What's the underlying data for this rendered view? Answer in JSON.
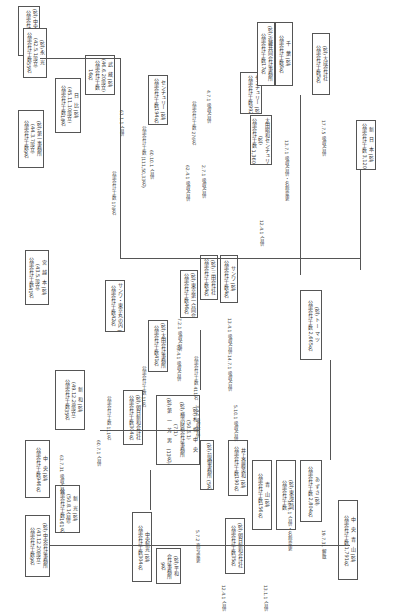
{
  "diagram": {
    "nodes": [
      {
        "id": "chuo_kaikei",
        "text": "(監) 中央会計事務所\n(43.12.20設立)\n公認会計士数9名"
      },
      {
        "id": "shinko",
        "text": "新　光 (監)\n(50.8.1合併)\n公認会計士数161名"
      },
      {
        "id": "chuo_shinko",
        "text": "中央新光 (監)\n公認会計士数304名"
      },
      {
        "id": "heiwa",
        "text": "(監) 平和\n会計事務所\n9名"
      },
      {
        "id": "genso",
        "text": "元 6.1\n公認会計士数\n544名"
      },
      {
        "id": "chuo",
        "text": "中　央 (監)\n公認会計士数946名"
      },
      {
        "id": "asahi_shinwa",
        "text": "(監) 朝日新和会計社\n公認会計士数35名"
      },
      {
        "id": "seiwa",
        "text": "(監) 朝日会計社\n(49.7.31設立)\n公認会計士数14名"
      },
      {
        "id": "shinwa",
        "text": "新　和 (監)\n(49.12.28設立)\n公認会計士数35名"
      },
      {
        "id": "kyoritsu",
        "text": "(監) 朝日新和会計社\n公認会計士数304名"
      },
      {
        "id": "sapporo",
        "text": "(監) 札　幌　中　央\n(50.6.1)\n(監) 横浜財務会計事務所\n(7.1)\n(監) 第　一　芳　男　(13名)"
      },
      {
        "id": "maebashi",
        "text": "(監) 前橋事務所 (5名)"
      },
      {
        "id": "inoue",
        "text": "井上斎藤英和 (監)\n公認会計士数190名"
      },
      {
        "id": "aoyama",
        "text": "青　山 (監)\n公認会計士数156名"
      },
      {
        "id": "chuo_aoyama",
        "text": "中　央　青　山 (監)\n公認会計士数 1,791名"
      },
      {
        "id": "nakagawa",
        "text": "(監) 中央会計事務所\n公認会計士数45名"
      },
      {
        "id": "miyakoshi",
        "text": "宮　越　本 (監)\n(43.5.設立)\n公認会計士数41名"
      },
      {
        "id": "century_ginza",
        "text": "サンワ・東京丸の内 (監)\n公認会計士数42名"
      },
      {
        "id": "ohta_tokyo",
        "text": "(監) 太田会計事務所\n公認会計士数41名"
      },
      {
        "id": "century_tokyo",
        "text": "(監) 東京第一合同会計\n公認会計士数46名"
      },
      {
        "id": "showa",
        "text": "(監) 三田会計社\n公認会計士数4名"
      },
      {
        "id": "sanwa",
        "text": "サンワ (監)\n公認会計士数4名"
      },
      {
        "id": "ohta_showa",
        "text": "(監) 太田昭和会計事務所\n公認会計士数41名"
      },
      {
        "id": "azusa",
        "text": "あ ず さ (監)\n公認会計士数 2,804名"
      },
      {
        "id": "tohmatsu",
        "text": "(監) ト ー マ ツ\n公認会計士数 2,665名"
      },
      {
        "id": "ohta_daiichi",
        "text": "太田昭和 (監)\n公認会計士数"
      },
      {
        "id": "nishi_shinju",
        "text": "(監) 西新宿会計事務所\n公認会計士数170名"
      },
      {
        "id": "daiichi_jimusho",
        "text": "(監) 第一事務所\n(44.3.7設立)\n公認会計士数9名"
      },
      {
        "id": "hibiya",
        "text": "日　比 (監)\n(45.11.10設立)\n公認会計士数18名"
      },
      {
        "id": "musashi",
        "text": "武　蔵 (監)\n(46.6.20設立)\n公認会計士数\n16名"
      },
      {
        "id": "nagase",
        "text": "(監) 永　光\n(42.5.1設立)\n公認会計士数55名"
      },
      {
        "id": "century",
        "text": "センチュリー (監)\n公認会計士数194名"
      },
      {
        "id": "century2",
        "text": "センチュリー (監)\n公認会計士数992名"
      },
      {
        "id": "shin_nihon",
        "text": "新日本 (監)\n公認会計士数 2,368名"
      },
      {
        "id": "shin_nihon_center",
        "text": "太田昭和センチュリー\n(監)\n公認会計士数 1,360名"
      },
      {
        "id": "nihon",
        "text": "新　日　本 (監)\n公認会計士数 3,120名"
      },
      {
        "id": "kinki",
        "text": "(監) 近畿共同会計事務所\n公認会計士数17名"
      },
      {
        "id": "chiba",
        "text": "千　葉 (監)\n公認会計士数6名"
      },
      {
        "id": "osaka",
        "text": "(監) 大成会計社\n公認会計士数5名"
      },
      {
        "id": "aka",
        "text": "赤 (監)\n40名"
      },
      {
        "id": "tokai",
        "text": "(監) 東海合同\n公認会計士数"
      }
    ],
    "labels": [
      "63.7.31 吸収合併",
      "60.7.1 合併",
      "5.7.2 商号変更",
      "12.4.1 合併",
      "13.1.1 合併",
      "19.7.31 解散",
      "16.1.1 合併・名称変更",
      "3.4.1 吸収合併",
      "5.10.1 吸収合併",
      "63.4.1 吸収合併",
      "60.10.1 合併",
      "7.2.1 吸収合併",
      "13.4.1 吸収合併",
      "14.7.1 吸収合併",
      "60.10.1 合併",
      "62.4.1 吸収合併",
      "2.7.1 吸収合併",
      "4.7.1 吸収合併",
      "61.1.1 合併",
      "12.4.1 合併",
      "13.7.1 吸収合併・名称変更",
      "17.7.5 吸収合併",
      "公認会計士数 111名",
      "公認会計士数 178名",
      "公認会計士数 276名",
      "公認会計士数 (111,50,33名)",
      "公認会計士数 411名",
      "公認会計士数 11名"
    ]
  }
}
